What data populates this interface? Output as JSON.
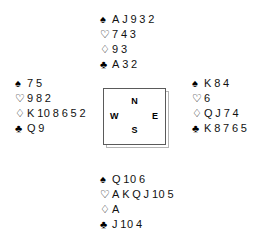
{
  "diagram": {
    "type": "bridge-deal",
    "suit_symbols": {
      "spades": "♠",
      "hearts": "♡",
      "diamonds": "♢",
      "clubs": "♣"
    },
    "compass": {
      "north": "N",
      "south": "S",
      "east": "E",
      "west": "W"
    },
    "hands": {
      "north": {
        "spades": [
          "A",
          "J",
          "9",
          "3",
          "2"
        ],
        "hearts": [
          "7",
          "4",
          "3"
        ],
        "diamonds": [
          "9",
          "3"
        ],
        "clubs": [
          "A",
          "3",
          "2"
        ]
      },
      "west": {
        "spades": [
          "7",
          "5"
        ],
        "hearts": [
          "9",
          "8",
          "2"
        ],
        "diamonds": [
          "K",
          "10",
          "8",
          "6",
          "5",
          "2"
        ],
        "clubs": [
          "Q",
          "9"
        ]
      },
      "east": {
        "spades": [
          "K",
          "8",
          "4"
        ],
        "hearts": [
          "6"
        ],
        "diamonds": [
          "Q",
          "J",
          "7",
          "4"
        ],
        "clubs": [
          "K",
          "8",
          "7",
          "6",
          "5"
        ]
      },
      "south": {
        "spades": [
          "Q",
          "10",
          "6"
        ],
        "hearts": [
          "A",
          "K",
          "Q",
          "J",
          "10",
          "5"
        ],
        "diamonds": [
          "A"
        ],
        "clubs": [
          "J",
          "10",
          "4"
        ]
      }
    }
  }
}
